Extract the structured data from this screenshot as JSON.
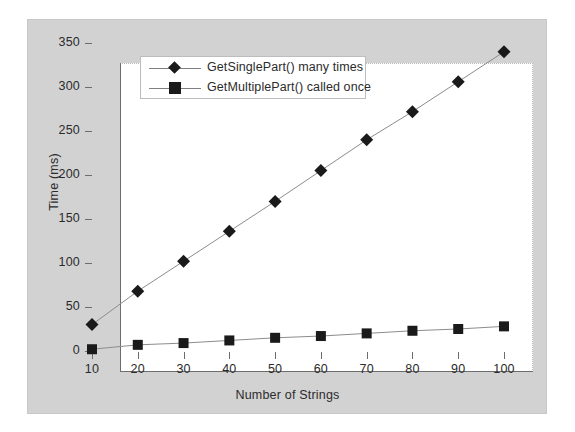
{
  "chart_data": {
    "type": "line",
    "title": "",
    "xlabel": "Number of Strings",
    "ylabel": "Time (ms)",
    "x": [
      10,
      20,
      30,
      40,
      50,
      60,
      70,
      80,
      90,
      100
    ],
    "xticks": [
      "10",
      "20",
      "30",
      "40",
      "50",
      "60",
      "70",
      "80",
      "90",
      "100"
    ],
    "yticks": [
      "0",
      "50",
      "100",
      "150",
      "200",
      "250",
      "300",
      "350"
    ],
    "xlim": [
      10,
      100
    ],
    "ylim": [
      0,
      350
    ],
    "grid": false,
    "legend_position": "upper-left-inside",
    "series": [
      {
        "name": "GetSinglePart() many times",
        "marker": "diamond",
        "color": "#1a1a1a",
        "values": [
          30,
          68,
          102,
          136,
          170,
          205,
          240,
          272,
          306,
          340
        ]
      },
      {
        "name": "GetMultiplePart() called once",
        "marker": "square",
        "color": "#1a1a1a",
        "values": [
          2,
          7,
          9,
          12,
          15,
          17,
          20,
          23,
          25,
          28
        ]
      }
    ]
  },
  "colors": {
    "panel_background": "#d2d2d2",
    "plot_background": "#ffffff",
    "axis": "#6d6d6d",
    "series_line": "#8c8c8c",
    "marker": "#1a1a1a",
    "text": "#2b2b2b",
    "legend_border": "#bdbdbd"
  }
}
